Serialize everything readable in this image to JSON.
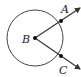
{
  "diagram": {
    "type": "circle-with-rays",
    "center": {
      "label": "B",
      "x": 35,
      "y": 38
    },
    "radius": 28,
    "points": [
      {
        "label": "A",
        "x": 61,
        "y": 21,
        "label_x": 61,
        "label_y": 13
      },
      {
        "label": "C",
        "x": 61,
        "y": 56,
        "label_x": 60,
        "label_y": 73
      }
    ],
    "rays": [
      {
        "from": "B",
        "through": "A",
        "tip_x": 80,
        "tip_y": 8
      },
      {
        "from": "B",
        "through": "C",
        "tip_x": 80,
        "tip_y": 69
      }
    ],
    "colors": {
      "stroke": "#333333",
      "point": "#111111"
    }
  }
}
